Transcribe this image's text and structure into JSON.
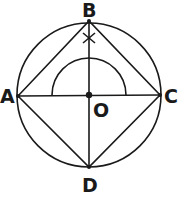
{
  "diagram": {
    "colors": {
      "stroke": "#1a1a1a",
      "background": "#ffffff"
    },
    "circle": {
      "center": "O",
      "cx": 89,
      "cy": 95,
      "r": 72
    },
    "points": {
      "A": {
        "label": "A",
        "x": 18,
        "y": 96
      },
      "B": {
        "label": "B",
        "x": 89,
        "y": 21
      },
      "C": {
        "label": "C",
        "x": 160,
        "y": 95
      },
      "D": {
        "label": "D",
        "x": 89,
        "y": 167
      },
      "O": {
        "label": "O",
        "x": 89,
        "y": 95
      }
    },
    "segments": [
      "AB",
      "BC",
      "CD",
      "DA",
      "AC",
      "BD"
    ],
    "arc": {
      "center": "O",
      "r": 37,
      "type": "semicircle-above-AC"
    },
    "mark": {
      "type": "cross",
      "on": "OB",
      "x": 89,
      "y": 38
    }
  }
}
